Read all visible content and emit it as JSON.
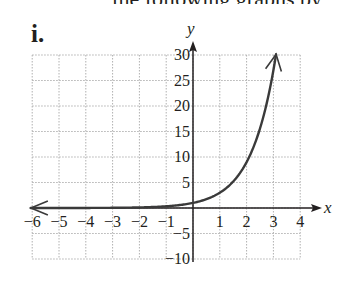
{
  "header": {
    "clipped_text": "the following graphs by",
    "problem_label": "i."
  },
  "chart_data": {
    "type": "line",
    "title": "",
    "xlabel": "x",
    "ylabel": "y",
    "xlim": [
      -6,
      4
    ],
    "ylim": [
      -10,
      30
    ],
    "grid": true,
    "x_ticks": [
      -6,
      -5,
      -4,
      -3,
      -2,
      -1,
      1,
      2,
      3,
      4
    ],
    "x_tick_labels": [
      "−6",
      "−5",
      "−4",
      "−3",
      "−2",
      "−1",
      "1",
      "2",
      "3",
      "4"
    ],
    "y_ticks": [
      30,
      25,
      20,
      15,
      10,
      5,
      -5,
      -10
    ],
    "y_tick_labels": [
      "30",
      "25",
      "20",
      "15",
      "10",
      "5",
      "−5",
      "−10"
    ],
    "series": [
      {
        "name": "y = 3^x",
        "x": [
          -6,
          -5,
          -4,
          -3,
          -2,
          -1,
          0,
          0.5,
          1,
          1.5,
          2,
          2.5,
          3,
          3.1
        ],
        "values": [
          0.001,
          0.004,
          0.012,
          0.037,
          0.111,
          0.333,
          1,
          1.73,
          3,
          5.2,
          9,
          15.6,
          27,
          30
        ],
        "arrow_left": true,
        "arrow_right": true
      }
    ],
    "colors": {
      "curve": "#3a3a3a",
      "axis": "#231f20",
      "grid": "#b0b0b0"
    }
  }
}
